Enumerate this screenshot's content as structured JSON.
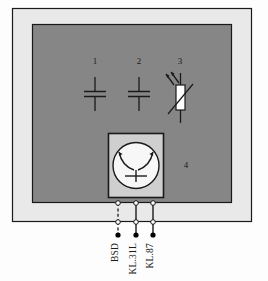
{
  "figure": {
    "kind": "wiring-schematic"
  },
  "colors": {
    "outer_frame_fill": "#e9e9e9",
    "inner_panel_fill": "#868686",
    "component_box_fill": "#cfcfcf",
    "motor_circle_fill": "#f7f7f7",
    "ldr_body_fill": "#ffffff",
    "line_color": "#1a1a1a",
    "terminal_open_fill": "#ffffff",
    "terminal_filled_fill": "#000000",
    "page_background": "#fdfdfd"
  },
  "components": [
    {
      "id": "component-1",
      "number": "1",
      "symbol": "capacitor",
      "x": 95,
      "label_y": 61
    },
    {
      "id": "component-2",
      "number": "2",
      "symbol": "capacitor",
      "x": 139,
      "label_y": 61
    },
    {
      "id": "component-3",
      "number": "3",
      "symbol": "light-dependent-resistor",
      "x": 180,
      "label_y": 61
    },
    {
      "id": "component-4",
      "number": "4",
      "symbol": "wiper-motor",
      "x": 173,
      "label_y": 165
    }
  ],
  "terminals": [
    {
      "id": "terminal-bsd",
      "label": "BSD",
      "x": 118,
      "line_style": "dashed"
    },
    {
      "id": "terminal-kl31l",
      "label": "KL.31L",
      "x": 136,
      "line_style": "solid"
    },
    {
      "id": "terminal-kl87",
      "label": "KL.87",
      "x": 153,
      "line_style": "solid"
    }
  ],
  "geometry": {
    "outer_frame": {
      "x": 12,
      "y": 8,
      "w": 240,
      "h": 214
    },
    "inner_panel": {
      "x": 32,
      "y": 24,
      "w": 200,
      "h": 179
    },
    "motor_box": {
      "x": 108,
      "y": 133,
      "w": 56,
      "h": 65
    },
    "motor_circle": {
      "cx": 136,
      "cy": 165,
      "r": 23
    },
    "ldr_body": {
      "x": 176,
      "y": 85,
      "w": 9,
      "h": 25
    },
    "terminal_row_top_y": 203,
    "terminal_row_mid_y": 222,
    "terminal_dot_y": 235,
    "terminal_label_y": 243
  }
}
